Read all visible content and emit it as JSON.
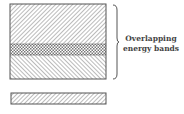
{
  "diagram": {
    "label_line1": "Overlapping",
    "label_line2": "energy bands",
    "bands": [
      {
        "name": "upper-band",
        "hatch": "forward-diagonal"
      },
      {
        "name": "overlap-region",
        "hatch": "cross"
      },
      {
        "name": "lower-band",
        "hatch": "backward-diagonal"
      },
      {
        "name": "separate-band",
        "hatch": "forward-diagonal"
      }
    ],
    "colors": {
      "stroke": "#555555",
      "hatch": "#777777",
      "background": "#ffffff"
    }
  }
}
